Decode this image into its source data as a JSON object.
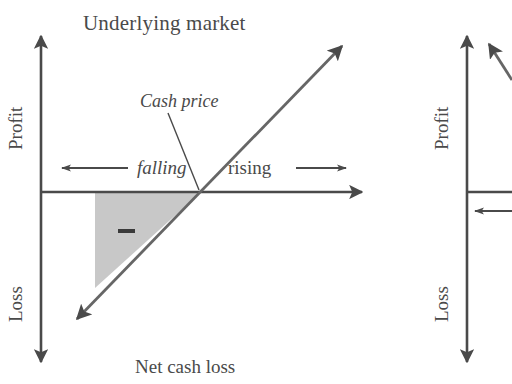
{
  "figure": {
    "kind": "payoff-diagram",
    "background_color": "#ffffff",
    "line_color": "#4a4a4a",
    "shade_color": "#c8c8c8"
  },
  "left_panel": {
    "title": "Underlying market",
    "y_axis_upper_label": "Profit",
    "y_axis_lower_label": "Loss",
    "annotation_cash_price": "Cash price",
    "direction_left_label": "falling",
    "direction_right_label": "rising",
    "caption": "Net cash loss",
    "shaded_region_sign": "−",
    "icons": {
      "left_arrow": "arrow-left-icon",
      "right_arrow": "arrow-right-icon",
      "payoff_line": "diagonal-payoff-line-icon",
      "minus": "minus-sign-icon"
    }
  },
  "right_panel": {
    "y_axis_upper_label": "Profit",
    "y_axis_lower_label": "Loss",
    "icons": {
      "left_arrow": "arrow-left-icon",
      "payoff_line": "diagonal-payoff-line-icon"
    }
  }
}
